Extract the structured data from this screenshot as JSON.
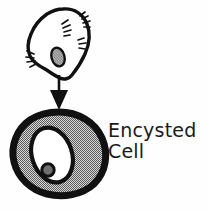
{
  "figure": {
    "background_color": "#fefefe",
    "ink_color": "#111111",
    "fill_gray": "#9a9a9a",
    "nucleus_gray": "#8f8f8f",
    "width": 209,
    "height": 210
  },
  "labels": {
    "encysted_cell_line_1": "Encysted",
    "encysted_cell_line_2": "Cell"
  },
  "diagram": {
    "top_cell": {
      "name": "trophozoite-cell",
      "description": "irregular amoeboid cell with cilia tufts, white cytoplasm, gray oval nucleus",
      "outline_color": "#111111",
      "fill_color": "#ffffff",
      "nucleus_fill": "#8f8f8f",
      "cilia_tuft_count": 4
    },
    "arrow": {
      "name": "transformation-arrow",
      "direction": "down",
      "color": "#111111"
    },
    "bottom_cell": {
      "name": "encysted-cell",
      "description": "thick-walled round cyst with stippled gray cytoplasm, white nucleus and dark nucleolus",
      "wall_color": "#111111",
      "cytoplasm_fill": "#9a9a9a",
      "nucleus_fill": "#ffffff",
      "nucleolus_fill": "#6f6f6f"
    }
  }
}
